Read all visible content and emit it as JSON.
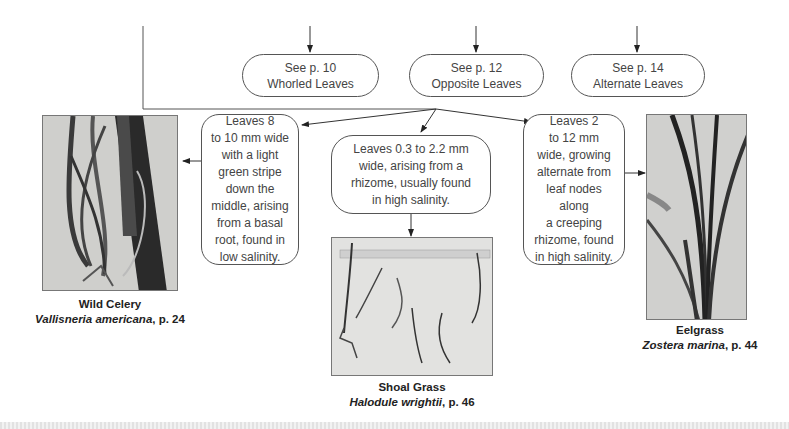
{
  "top_pills": [
    {
      "line1": "See p. 10",
      "line2": "Whorled Leaves"
    },
    {
      "line1": "See p. 12",
      "line2": "Opposite Leaves"
    },
    {
      "line1": "See p. 14",
      "line2": "Alternate Leaves"
    }
  ],
  "descriptions": {
    "wild_celery": [
      "Leaves 8",
      "to 10 mm wide",
      "with a light",
      "green stripe",
      "down the",
      "middle, arising",
      "from a basal",
      "root, found in",
      "low salinity."
    ],
    "shoal_grass": [
      "Leaves 0.3 to 2.2 mm",
      "wide, arising from a",
      "rhizome, usually found",
      "in high salinity."
    ],
    "eelgrass": [
      "Leaves 2",
      "to 12 mm",
      "wide, growing",
      "alternate from",
      "leaf nodes along",
      "a creeping",
      "rhizome, found",
      "in high salinity."
    ]
  },
  "species": [
    {
      "common": "Wild Celery",
      "scientific": "Vallisneria americana",
      "page": ", p. 24"
    },
    {
      "common": "Shoal Grass",
      "scientific": "Halodule wrightii",
      "page": ", p. 46"
    },
    {
      "common": "Eelgrass",
      "scientific": "Zostera marina",
      "page": ", p. 44"
    }
  ],
  "colors": {
    "line": "#333333",
    "border": "#555555",
    "text": "#444444"
  }
}
